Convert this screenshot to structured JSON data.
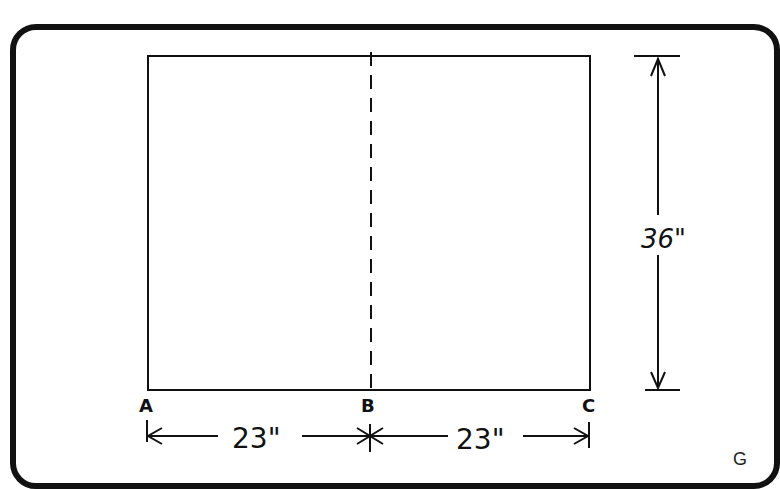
{
  "diagram": {
    "figure_label": "G",
    "points": {
      "a": "A",
      "b": "B",
      "c": "C"
    },
    "dimensions": {
      "height": "36\"",
      "width_left": "23\"",
      "width_right": "23\""
    },
    "fold_line": "dashed center line B"
  }
}
